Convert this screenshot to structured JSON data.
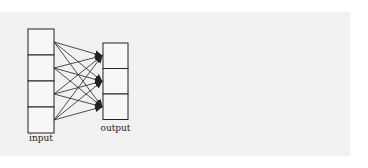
{
  "diagram": {
    "type": "fully-connected-layer",
    "input_layer": {
      "label": "input",
      "cell_count": 4
    },
    "output_layer": {
      "label": "output",
      "cell_count": 3
    },
    "connections": "every input cell connects to every output cell (arrow pointing to output)",
    "colors": {
      "stroke": "#222222",
      "cell_fill": "#f7f7f7",
      "panel_background": "#f1f1f1"
    }
  }
}
